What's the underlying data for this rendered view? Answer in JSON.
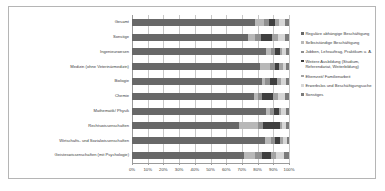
{
  "chart_data": {
    "type": "bar",
    "orientation": "horizontal",
    "stacked": true,
    "normalized": true,
    "title": "",
    "xlabel": "",
    "ylabel": "",
    "xlim": [
      0,
      100
    ],
    "grid": true,
    "legend_position": "right",
    "tick_labels": [
      "0%",
      "10%",
      "20%",
      "30%",
      "40%",
      "50%",
      "60%",
      "70%",
      "80%",
      "90%",
      "100%"
    ],
    "ticks": [
      0,
      10,
      20,
      30,
      40,
      50,
      60,
      70,
      80,
      90,
      100
    ],
    "categories": [
      "Gesamt",
      "Sonstige",
      "Ingenieurwesen",
      "Medizin (ohne Veterinärmedizin)",
      "Biologie",
      "Chemie",
      "Mathematik/ Physik",
      "Rechtswissenschaften",
      "Wirtschafts- und Sozialwissenschaften",
      "Geisteswissenschaften (mit Psychologie)"
    ],
    "series": [
      {
        "name": "Reguläre abhängige Beschäftigung",
        "color": "#686868",
        "values": [
          78.5,
          74.0,
          85.5,
          81.5,
          83.0,
          78.0,
          85.5,
          68.0,
          85.0,
          71.5
        ]
      },
      {
        "name": "Selbstständige Beschäftigung",
        "color": "#b8b8b8",
        "values": [
          5.5,
          4.5,
          3.0,
          6.5,
          1.5,
          2.0,
          2.5,
          12.5,
          3.5,
          7.0
        ]
      },
      {
        "name": "Jobben, Lehrauftrag, Praktikum u. Ä.",
        "color": "#8f8f8f",
        "values": [
          3.5,
          3.5,
          2.5,
          3.0,
          3.5,
          3.0,
          2.5,
          3.0,
          2.5,
          4.5
        ]
      },
      {
        "name": "Weitere Ausbildung (Studium, Referendariat, Weiterbildung)",
        "color": "#3f3f3f",
        "values": [
          3.5,
          7.5,
          3.0,
          2.5,
          4.5,
          7.0,
          3.0,
          10.5,
          3.5,
          5.5
        ]
      },
      {
        "name": "Elternzeit/ Familienarbeit",
        "color": "#a3a3a3",
        "values": [
          2.5,
          3.5,
          1.5,
          2.5,
          2.5,
          3.0,
          1.5,
          1.5,
          1.5,
          3.5
        ]
      },
      {
        "name": "Erwerbslos und Beschäftigungsuche",
        "color": "#d6d6d6",
        "values": [
          4.0,
          4.5,
          2.5,
          2.0,
          3.0,
          4.5,
          3.0,
          2.5,
          2.5,
          5.0
        ]
      },
      {
        "name": "Sonstiges",
        "color": "#7b7b7b",
        "values": [
          2.5,
          2.5,
          2.0,
          2.0,
          2.0,
          2.5,
          2.0,
          2.0,
          1.5,
          3.0
        ]
      }
    ]
  }
}
